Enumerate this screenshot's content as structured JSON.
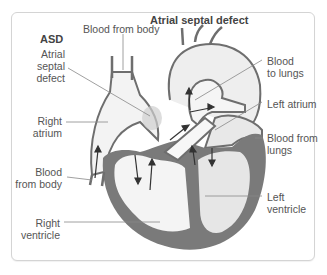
{
  "diagram": {
    "title": "Atrial septal defect",
    "abbreviation": "ASD",
    "labels": {
      "atrial_septal_defect": [
        "Atrial",
        "septal",
        "defect"
      ],
      "blood_from_body_top": "Blood from body",
      "right_atrium": [
        "Right",
        "atrium"
      ],
      "blood_from_body_bottom": [
        "Blood",
        "from body"
      ],
      "right_ventricle": [
        "Right",
        "ventricle"
      ],
      "blood_to_lungs": [
        "Blood",
        "to lungs"
      ],
      "left_atrium": "Left atrium",
      "blood_from_lungs": [
        "Blood from",
        "lungs"
      ],
      "left_ventricle": [
        "Left",
        "ventricle"
      ]
    },
    "colors": {
      "muscle": "#7a7a7a",
      "vessel_outline": "#6e6e6e",
      "chamber_light": "#f2f2f2",
      "chamber_mid": "#e6e6e6",
      "leader_line": "#888888",
      "text": "#555555",
      "border": "#d4d4d4"
    }
  }
}
